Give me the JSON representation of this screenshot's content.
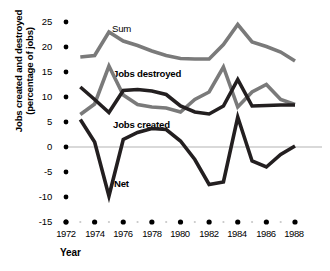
{
  "chart_data": {
    "type": "line",
    "title": "",
    "subtitle": "",
    "xlabel": "Year",
    "ylabel": "Jobs created and destroyed (percentage of jobs)",
    "ylabel_line1": "Jobs created and destroyed",
    "ylabel_line2": "(percentage of jobs)",
    "xlim": [
      1972,
      1988
    ],
    "ylim": [
      -15,
      25
    ],
    "grid": false,
    "zero_line": true,
    "legend_position": "inline-annotations",
    "x_tick_labels": [
      "1972",
      "1974",
      "1976",
      "1978",
      "1980",
      "1982",
      "1984",
      "1986",
      "1988"
    ],
    "x_ticks": [
      1972,
      1974,
      1976,
      1978,
      1980,
      1982,
      1984,
      1986,
      1988
    ],
    "x_minor_ticks": [
      1973,
      1975,
      1977,
      1979,
      1981,
      1983,
      1985,
      1987
    ],
    "y_tick_labels": [
      "25",
      "20",
      "15",
      "10",
      "5",
      "0",
      "-5",
      "-10",
      "-15"
    ],
    "y_ticks": [
      25,
      20,
      15,
      10,
      5,
      0,
      -5,
      -10,
      -15
    ],
    "x": [
      1973,
      1974,
      1975,
      1976,
      1977,
      1978,
      1979,
      1980,
      1981,
      1982,
      1983,
      1984,
      1985,
      1986,
      1987,
      1988
    ],
    "series": [
      {
        "name": "Sum",
        "color": "#7a7a7a",
        "values": [
          18.0,
          18.3,
          23.0,
          21.2,
          20.3,
          19.2,
          18.3,
          17.7,
          17.6,
          17.6,
          20.5,
          24.5,
          21.0,
          20.1,
          19.0,
          17.2
        ]
      },
      {
        "name": "Jobs destroyed",
        "color": "#7a7a7a",
        "values": [
          6.5,
          8.6,
          16.2,
          10.4,
          8.5,
          8.0,
          7.8,
          7.0,
          9.5,
          11.0,
          16.0,
          8.0,
          11.0,
          12.5,
          9.5,
          8.5
        ]
      },
      {
        "name": "Jobs created",
        "color": "#231f20",
        "values": [
          12.0,
          9.5,
          6.9,
          11.3,
          11.5,
          11.2,
          10.5,
          8.2,
          7.0,
          6.6,
          8.2,
          13.5,
          8.2,
          8.3,
          8.4,
          8.4
        ]
      },
      {
        "name": "Net",
        "color": "#231f20",
        "values": [
          5.5,
          1.0,
          -9.8,
          1.5,
          2.9,
          3.7,
          3.5,
          1.2,
          -2.5,
          -7.5,
          -7.0,
          6.0,
          -2.8,
          -4.0,
          -1.5,
          0.2
        ]
      }
    ],
    "annotations": [
      {
        "text": "Sum",
        "bold": false
      },
      {
        "text": "Jobs destroyed",
        "bold": true
      },
      {
        "text": "Jobs created",
        "bold": true
      },
      {
        "text": "Net",
        "bold": true
      }
    ]
  },
  "colors": {
    "gray_series": "#7a7a7a",
    "dark_series": "#231f20",
    "zero_line": "#d9d9d9",
    "tick_dot": "#000000",
    "minor_dot": "#c9c9c9",
    "background": "#ffffff"
  }
}
